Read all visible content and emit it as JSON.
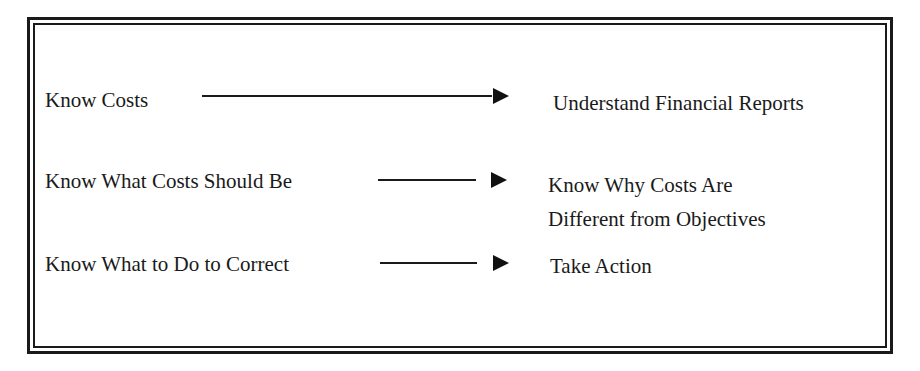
{
  "diagram": {
    "rows": [
      {
        "left": "Know Costs",
        "right": [
          "Understand Financial Reports"
        ]
      },
      {
        "left": "Know What Costs Should Be",
        "right": [
          "Know Why Costs Are",
          "Different from Objectives"
        ]
      },
      {
        "left": "Know What to Do to Correct",
        "right": [
          "Take Action"
        ]
      }
    ],
    "colors": {
      "ink": "#1a1a1a",
      "background": "#ffffff"
    },
    "connector": "arrow-right"
  }
}
